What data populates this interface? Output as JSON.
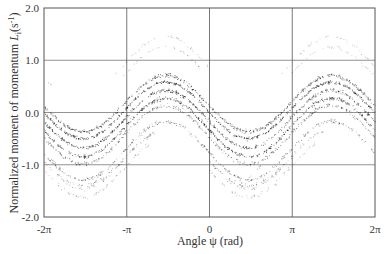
{
  "chart_data": {
    "type": "scatter",
    "title": "",
    "xlabel": "Angle ψ (rad)",
    "ylabel": "Normalized moment of momentum ℒᵢ (s⁻¹)",
    "ylabel_main": "Normalized moment of momentum ",
    "ylabel_symbol": "L",
    "ylabel_sub": "i",
    "ylabel_unit_open": "(s",
    "ylabel_unit_sup": "-1",
    "ylabel_unit_close": ")",
    "xlim": [
      -6.2832,
      6.2832
    ],
    "ylim": [
      -2.0,
      2.0
    ],
    "grid": true,
    "legend": null,
    "x_ticks": [
      {
        "value": -6.2832,
        "label": "-2π"
      },
      {
        "value": -3.1416,
        "label": "-π"
      },
      {
        "value": 0,
        "label": "0"
      },
      {
        "value": 3.1416,
        "label": "π"
      },
      {
        "value": 6.2832,
        "label": "2π"
      }
    ],
    "y_ticks": [
      {
        "value": 2.0,
        "label": "2.0"
      },
      {
        "value": 1.0,
        "label": "1.0"
      },
      {
        "value": 0.0,
        "label": "0.0"
      },
      {
        "value": -1.0,
        "label": "-1.0"
      },
      {
        "value": -2.0,
        "label": "-2.0"
      }
    ],
    "series": [
      {
        "name": "band-outer-1",
        "center": 0.92,
        "amp": 0.55,
        "phase": 0.1,
        "ranges": [
          [
            -3.6,
            0.0
          ],
          [
            2.7,
            6.28
          ]
        ],
        "density": 140,
        "spread": 0.03,
        "alpha": 0.35
      },
      {
        "name": "band-outer-2",
        "center": 0.72,
        "amp": 0.55,
        "phase": 0.1,
        "ranges": [
          [
            -3.3,
            -0.2
          ],
          [
            3.0,
            6.28
          ],
          [
            -6.28,
            -5.9
          ]
        ],
        "density": 140,
        "spread": 0.03,
        "alpha": 0.35
      },
      {
        "name": "band-1",
        "center": 0.18,
        "amp": 0.54,
        "phase": 0.1,
        "ranges": [
          [
            -6.28,
            6.28
          ]
        ],
        "density": 520,
        "spread": 0.035,
        "alpha": 0.75
      },
      {
        "name": "band-2",
        "center": 0.05,
        "amp": 0.54,
        "phase": 0.1,
        "ranges": [
          [
            -6.28,
            6.28
          ]
        ],
        "density": 520,
        "spread": 0.03,
        "alpha": 0.85
      },
      {
        "name": "band-3",
        "center": -0.12,
        "amp": 0.55,
        "phase": 0.1,
        "ranges": [
          [
            -6.28,
            6.28
          ]
        ],
        "density": 480,
        "spread": 0.035,
        "alpha": 0.8
      },
      {
        "name": "band-4",
        "center": -0.28,
        "amp": 0.56,
        "phase": 0.1,
        "ranges": [
          [
            -6.28,
            6.28
          ]
        ],
        "density": 480,
        "spread": 0.035,
        "alpha": 0.85
      },
      {
        "name": "band-5",
        "center": -0.42,
        "amp": 0.56,
        "phase": 0.1,
        "ranges": [
          [
            -6.28,
            6.28
          ]
        ],
        "density": 380,
        "spread": 0.04,
        "alpha": 0.6
      },
      {
        "name": "band-6",
        "center": -0.72,
        "amp": 0.56,
        "phase": 0.1,
        "ranges": [
          [
            -6.28,
            6.28
          ]
        ],
        "density": 360,
        "spread": 0.04,
        "alpha": 0.55
      },
      {
        "name": "band-7",
        "center": -0.88,
        "amp": 0.56,
        "phase": 0.1,
        "ranges": [
          [
            -6.28,
            -2.0
          ],
          [
            0.0,
            4.3
          ]
        ],
        "density": 260,
        "spread": 0.04,
        "alpha": 0.45
      },
      {
        "name": "band-8",
        "center": -1.05,
        "amp": 0.56,
        "phase": 0.1,
        "ranges": [
          [
            -6.28,
            -2.3
          ],
          [
            0.0,
            4.0
          ]
        ],
        "density": 220,
        "spread": 0.04,
        "alpha": 0.35
      },
      {
        "name": "segment-descending",
        "center": -0.88,
        "amp": 0.5,
        "phase": 0.1,
        "ranges": [
          [
            -5.9,
            -3.3
          ],
          [
            0.9,
            3.3
          ]
        ],
        "density": 160,
        "spread": 0.04,
        "alpha": 0.55,
        "offset": 0.0,
        "shift_y": -0.0
      },
      {
        "name": "segment-lower-right",
        "center": -1.0,
        "amp": 0.6,
        "phase": 1.2,
        "ranges": [
          [
            1.1,
            3.3
          ]
        ],
        "density": 110,
        "spread": 0.03,
        "alpha": 0.55
      }
    ]
  }
}
